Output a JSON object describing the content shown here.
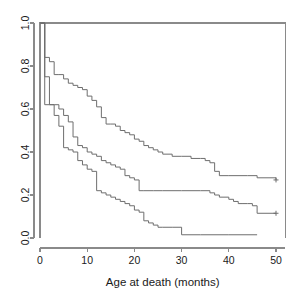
{
  "chart_data": {
    "type": "line",
    "title": "",
    "subtitle": "",
    "xlabel": "Age at death (months)",
    "ylabel": "",
    "xlim": [
      0,
      52
    ],
    "ylim": [
      0.0,
      1.0
    ],
    "xticks": [
      0,
      10,
      20,
      30,
      40,
      50
    ],
    "xticklabels": [
      "0",
      "10",
      "20",
      "30",
      "40",
      "50"
    ],
    "yticks": [
      0.0,
      0.2,
      0.4,
      0.6,
      0.8,
      1.0
    ],
    "yticklabels": [
      "0.0",
      "0.2",
      "0.4",
      "0.6",
      "0.8",
      "1.0"
    ],
    "grid": false,
    "legend": "none",
    "box": true,
    "style": "step-post",
    "line_color": "#6e6e6e",
    "axis_color": "#8a8a8a",
    "text_color": "#1a1a1a",
    "background": "#ffffff",
    "series": [
      {
        "name": "upper-curve",
        "censored_at": [
          [
            50,
            0.27
          ]
        ],
        "x": [
          0,
          1,
          1,
          2,
          2,
          3,
          3,
          4,
          5,
          6,
          7,
          8,
          9,
          10,
          11,
          12,
          13,
          14,
          15,
          16,
          17,
          18,
          19,
          20,
          21,
          22,
          23,
          24,
          25,
          26,
          28,
          30,
          32,
          34,
          35,
          36,
          37,
          38,
          40,
          44,
          46,
          50
        ],
        "y": [
          1.0,
          1.0,
          0.84,
          0.84,
          0.82,
          0.82,
          0.76,
          0.76,
          0.74,
          0.72,
          0.71,
          0.7,
          0.69,
          0.66,
          0.64,
          0.61,
          0.56,
          0.53,
          0.53,
          0.52,
          0.5,
          0.49,
          0.48,
          0.46,
          0.45,
          0.43,
          0.42,
          0.41,
          0.4,
          0.39,
          0.38,
          0.38,
          0.37,
          0.37,
          0.36,
          0.35,
          0.31,
          0.29,
          0.29,
          0.29,
          0.28,
          0.27
        ]
      },
      {
        "name": "middle-curve",
        "censored_at": [
          [
            50,
            0.115
          ]
        ],
        "x": [
          0,
          1,
          1,
          2,
          2,
          3,
          4,
          5,
          6,
          7,
          8,
          9,
          10,
          11,
          12,
          13,
          14,
          15,
          16,
          17,
          18,
          19,
          20,
          21,
          22,
          24,
          26,
          30,
          34,
          36,
          37,
          38,
          40,
          41,
          42,
          43,
          44,
          45,
          46,
          50
        ],
        "y": [
          1.0,
          1.0,
          0.75,
          0.75,
          0.62,
          0.62,
          0.6,
          0.57,
          0.54,
          0.47,
          0.43,
          0.42,
          0.4,
          0.39,
          0.38,
          0.36,
          0.35,
          0.34,
          0.33,
          0.32,
          0.29,
          0.28,
          0.27,
          0.22,
          0.22,
          0.22,
          0.22,
          0.22,
          0.22,
          0.21,
          0.2,
          0.19,
          0.18,
          0.17,
          0.16,
          0.16,
          0.16,
          0.15,
          0.115,
          0.115
        ]
      },
      {
        "name": "lower-curve",
        "censored_at": [],
        "x": [
          0,
          1,
          1,
          2,
          3,
          4,
          5,
          6,
          7,
          8,
          9,
          10,
          11,
          12,
          13,
          14,
          15,
          16,
          17,
          18,
          19,
          20,
          21,
          22,
          23,
          24,
          25,
          26,
          28,
          30,
          34,
          40,
          46
        ],
        "y": [
          1.0,
          1.0,
          0.62,
          0.62,
          0.57,
          0.52,
          0.42,
          0.41,
          0.4,
          0.36,
          0.34,
          0.32,
          0.31,
          0.22,
          0.21,
          0.2,
          0.19,
          0.18,
          0.17,
          0.16,
          0.15,
          0.13,
          0.12,
          0.08,
          0.07,
          0.06,
          0.05,
          0.05,
          0.05,
          0.015,
          0.015,
          0.015,
          0.015
        ]
      }
    ]
  },
  "axes": {
    "x_title": "Age at death (months)"
  }
}
